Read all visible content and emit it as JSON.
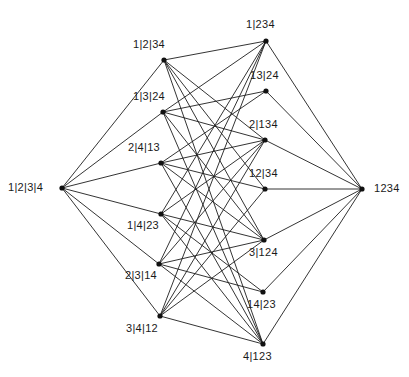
{
  "diagram": {
    "kind": "hasse-diagram",
    "canvas": {
      "width": 409,
      "height": 377
    },
    "style": {
      "background_color": "#ffffff",
      "edge_color": "#1d1d1d",
      "node_color": "#111111",
      "label_color": "#1a1a1a",
      "edge_width": 0.9,
      "node_radius": 2.6,
      "label_font_size": 11
    },
    "nodes": [
      {
        "id": "bottom",
        "label": "1|2|3|4",
        "x": 62,
        "y": 188,
        "label_x": 8,
        "label_y": 181,
        "rank": 0
      },
      {
        "id": "1-2-34",
        "label": "1|2|34",
        "x": 164,
        "y": 60,
        "label_x": 133,
        "label_y": 38,
        "rank": 1
      },
      {
        "id": "1-3-24",
        "label": "1|3|24",
        "x": 163,
        "y": 112,
        "label_x": 133,
        "label_y": 90,
        "rank": 1
      },
      {
        "id": "2-4-13",
        "label": "2|4|13",
        "x": 161,
        "y": 163,
        "label_x": 128,
        "label_y": 141,
        "rank": 1
      },
      {
        "id": "1-4-23",
        "label": "1|4|23",
        "x": 161,
        "y": 214,
        "label_x": 127,
        "label_y": 219,
        "rank": 1
      },
      {
        "id": "2-3-14",
        "label": "2|3|14",
        "x": 159,
        "y": 264,
        "label_x": 125,
        "label_y": 269,
        "rank": 1
      },
      {
        "id": "3-4-12",
        "label": "3|4|12",
        "x": 160,
        "y": 316,
        "label_x": 126,
        "label_y": 322,
        "rank": 1
      },
      {
        "id": "1-234",
        "label": "1|234",
        "x": 266,
        "y": 41,
        "label_x": 246,
        "label_y": 18,
        "rank": 2
      },
      {
        "id": "13-24",
        "label": "13|24",
        "x": 266,
        "y": 91,
        "label_x": 250,
        "label_y": 69,
        "rank": 2
      },
      {
        "id": "2-134",
        "label": "2|134",
        "x": 265,
        "y": 140,
        "label_x": 249,
        "label_y": 118,
        "rank": 2
      },
      {
        "id": "12-34",
        "label": "12|34",
        "x": 265,
        "y": 189,
        "label_x": 249,
        "label_y": 167,
        "rank": 2
      },
      {
        "id": "3-124",
        "label": "3|124",
        "x": 264,
        "y": 240,
        "label_x": 249,
        "label_y": 246,
        "rank": 2
      },
      {
        "id": "14-23",
        "label": "14|23",
        "x": 263,
        "y": 292,
        "label_x": 247,
        "label_y": 298,
        "rank": 2
      },
      {
        "id": "4-123",
        "label": "4|123",
        "x": 263,
        "y": 344,
        "label_x": 243,
        "label_y": 350,
        "rank": 2
      },
      {
        "id": "top",
        "label": "1234",
        "x": 362,
        "y": 189,
        "label_x": 374,
        "label_y": 182,
        "rank": 3
      }
    ],
    "edges": [
      {
        "from": "bottom",
        "to": "1-2-34"
      },
      {
        "from": "bottom",
        "to": "1-3-24"
      },
      {
        "from": "bottom",
        "to": "2-4-13"
      },
      {
        "from": "bottom",
        "to": "1-4-23"
      },
      {
        "from": "bottom",
        "to": "2-3-14"
      },
      {
        "from": "bottom",
        "to": "3-4-12"
      },
      {
        "from": "1-2-34",
        "to": "1-234"
      },
      {
        "from": "1-2-34",
        "to": "2-134"
      },
      {
        "from": "1-2-34",
        "to": "12-34"
      },
      {
        "from": "1-2-34",
        "to": "3-124"
      },
      {
        "from": "1-2-34",
        "to": "4-123"
      },
      {
        "from": "1-3-24",
        "to": "1-234"
      },
      {
        "from": "1-3-24",
        "to": "13-24"
      },
      {
        "from": "1-3-24",
        "to": "2-134"
      },
      {
        "from": "1-3-24",
        "to": "3-124"
      },
      {
        "from": "1-3-24",
        "to": "4-123"
      },
      {
        "from": "2-4-13",
        "to": "13-24"
      },
      {
        "from": "2-4-13",
        "to": "2-134"
      },
      {
        "from": "2-4-13",
        "to": "12-34"
      },
      {
        "from": "2-4-13",
        "to": "3-124"
      },
      {
        "from": "2-4-13",
        "to": "4-123"
      },
      {
        "from": "1-4-23",
        "to": "1-234"
      },
      {
        "from": "1-4-23",
        "to": "2-134"
      },
      {
        "from": "1-4-23",
        "to": "3-124"
      },
      {
        "from": "1-4-23",
        "to": "14-23"
      },
      {
        "from": "1-4-23",
        "to": "4-123"
      },
      {
        "from": "2-3-14",
        "to": "1-234"
      },
      {
        "from": "2-3-14",
        "to": "2-134"
      },
      {
        "from": "2-3-14",
        "to": "3-124"
      },
      {
        "from": "2-3-14",
        "to": "14-23"
      },
      {
        "from": "2-3-14",
        "to": "4-123"
      },
      {
        "from": "3-4-12",
        "to": "1-234"
      },
      {
        "from": "3-4-12",
        "to": "2-134"
      },
      {
        "from": "3-4-12",
        "to": "12-34"
      },
      {
        "from": "3-4-12",
        "to": "3-124"
      },
      {
        "from": "3-4-12",
        "to": "4-123"
      },
      {
        "from": "1-234",
        "to": "top"
      },
      {
        "from": "13-24",
        "to": "top"
      },
      {
        "from": "2-134",
        "to": "top"
      },
      {
        "from": "12-34",
        "to": "top"
      },
      {
        "from": "3-124",
        "to": "top"
      },
      {
        "from": "14-23",
        "to": "top"
      },
      {
        "from": "4-123",
        "to": "top"
      }
    ]
  }
}
